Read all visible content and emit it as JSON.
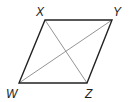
{
  "diagram": {
    "type": "parallelogram-with-diagonals",
    "stroke_color": "#222222",
    "diagonal_color": "#888888",
    "vertices": {
      "X": {
        "label": "X",
        "x": 45,
        "y": 20
      },
      "Y": {
        "label": "Y",
        "x": 112,
        "y": 20
      },
      "Z": {
        "label": "Z",
        "x": 87,
        "y": 83
      },
      "W": {
        "label": "W",
        "x": 19,
        "y": 83
      }
    },
    "sides": [
      "XY",
      "YZ",
      "ZW",
      "WX"
    ],
    "diagonals": [
      "XZ",
      "WY"
    ]
  }
}
